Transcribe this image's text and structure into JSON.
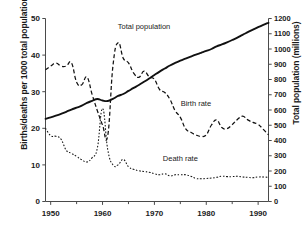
{
  "chart_data": {
    "type": "line",
    "title": "",
    "xlabel": "",
    "ylabel": "Births/deaths per 1000 total population",
    "ylabel_right": "Total population (millions)",
    "xlim": [
      1949,
      1992
    ],
    "ylim": [
      0,
      50
    ],
    "ylim_right": [
      0,
      1200
    ],
    "grid": false,
    "legend_position": "inline-annotations",
    "xticks": [
      1950,
      1960,
      1970,
      1980,
      1990
    ],
    "xticks_minor": [
      1955,
      1965,
      1975,
      1985
    ],
    "yticks_left": [
      0,
      10,
      20,
      30,
      40,
      50
    ],
    "yticks_right": [
      0,
      100,
      200,
      300,
      400,
      500,
      600,
      700,
      800,
      900,
      1000,
      1100,
      1200
    ],
    "annotations": [
      {
        "text": "Total population",
        "x": 1968,
        "y": 47
      },
      {
        "text": "Birth rate",
        "x": 1978,
        "y": 26
      },
      {
        "text": "Death rate",
        "x": 1975,
        "y": 11
      }
    ],
    "series": [
      {
        "name": "Total population",
        "axis": "right",
        "style": "solid",
        "x": [
          1949,
          1950,
          1951,
          1952,
          1953,
          1954,
          1955,
          1956,
          1957,
          1958,
          1959,
          1960,
          1961,
          1962,
          1963,
          1964,
          1965,
          1966,
          1967,
          1968,
          1969,
          1970,
          1971,
          1972,
          1973,
          1974,
          1975,
          1976,
          1977,
          1978,
          1979,
          1980,
          1981,
          1982,
          1983,
          1984,
          1985,
          1986,
          1987,
          1988,
          1989,
          1990,
          1991,
          1992
        ],
        "values": [
          542,
          552,
          563,
          575,
          588,
          603,
          615,
          628,
          647,
          660,
          672,
          662,
          659,
          673,
          692,
          705,
          725,
          745,
          764,
          785,
          807,
          830,
          852,
          872,
          892,
          909,
          924,
          937,
          950,
          963,
          975,
          987,
          1000,
          1017,
          1030,
          1044,
          1059,
          1075,
          1093,
          1110,
          1127,
          1143,
          1158,
          1172
        ]
      },
      {
        "name": "Birth rate",
        "axis": "left",
        "style": "dashed",
        "x": [
          1949,
          1950,
          1951,
          1952,
          1953,
          1954,
          1955,
          1956,
          1957,
          1958,
          1959,
          1960,
          1961,
          1962,
          1963,
          1964,
          1965,
          1966,
          1967,
          1968,
          1969,
          1970,
          1971,
          1972,
          1973,
          1974,
          1975,
          1976,
          1977,
          1978,
          1979,
          1980,
          1981,
          1982,
          1983,
          1984,
          1985,
          1986,
          1987,
          1988,
          1989,
          1990,
          1991,
          1992
        ],
        "values": [
          36.0,
          37.0,
          37.8,
          37.0,
          37.0,
          37.9,
          32.6,
          31.9,
          34.0,
          29.2,
          24.8,
          20.9,
          18.0,
          37.0,
          43.4,
          39.1,
          37.9,
          35.1,
          33.9,
          35.6,
          34.1,
          33.4,
          30.6,
          29.8,
          27.9,
          24.8,
          23.0,
          19.9,
          18.9,
          18.2,
          17.8,
          18.2,
          20.9,
          22.3,
          20.2,
          19.9,
          21.0,
          22.4,
          23.3,
          22.3,
          21.6,
          21.1,
          19.7,
          18.2
        ]
      },
      {
        "name": "Death rate",
        "axis": "left",
        "style": "dotted",
        "x": [
          1949,
          1950,
          1951,
          1952,
          1953,
          1954,
          1955,
          1956,
          1957,
          1958,
          1959,
          1960,
          1961,
          1962,
          1963,
          1964,
          1965,
          1966,
          1967,
          1968,
          1969,
          1970,
          1971,
          1972,
          1973,
          1974,
          1975,
          1976,
          1977,
          1978,
          1979,
          1980,
          1981,
          1982,
          1983,
          1984,
          1985,
          1986,
          1987,
          1988,
          1989,
          1990,
          1991,
          1992
        ],
        "values": [
          20.0,
          18.0,
          17.8,
          17.0,
          14.0,
          13.2,
          12.3,
          11.4,
          10.8,
          12.0,
          14.6,
          25.4,
          14.2,
          10.0,
          10.0,
          11.5,
          9.5,
          8.8,
          8.4,
          8.2,
          8.0,
          7.6,
          7.3,
          7.6,
          7.0,
          7.3,
          7.3,
          7.3,
          6.9,
          6.3,
          6.2,
          6.3,
          6.4,
          6.6,
          6.9,
          6.8,
          6.8,
          6.9,
          6.7,
          6.6,
          6.5,
          6.7,
          6.7,
          6.6
        ]
      }
    ]
  },
  "axes": {
    "left_title": "Births/deaths per 1000 total population",
    "right_title": "Total population (millions)"
  },
  "labels": {
    "total_population": "Total population",
    "birth_rate": "Birth rate",
    "death_rate": "Death rate"
  },
  "ticks": {
    "x": [
      "1950",
      "1960",
      "1970",
      "1980",
      "1990"
    ],
    "left": [
      "0",
      "10",
      "20",
      "30",
      "40",
      "50"
    ],
    "right": [
      "0",
      "100",
      "200",
      "300",
      "400",
      "500",
      "600",
      "700",
      "800",
      "900",
      "1000",
      "1100",
      "1200"
    ]
  }
}
